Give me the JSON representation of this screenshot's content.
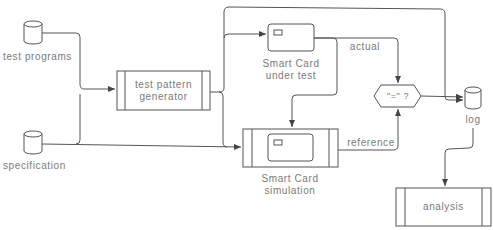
{
  "diagram": {
    "type": "flowchart",
    "nodes": {
      "test_programs": {
        "label": "test programs",
        "shape": "database"
      },
      "specification": {
        "label": "specification",
        "shape": "database"
      },
      "generator": {
        "line1": "test pattern",
        "line2": "generator",
        "shape": "process"
      },
      "card_under_test": {
        "line1": "Smart Card",
        "line2": "under test",
        "shape": "smart-card"
      },
      "card_simulation": {
        "line1": "Smart Card",
        "line2": "simulation",
        "shape": "process-with-card"
      },
      "compare": {
        "label": "\"=\" ?",
        "shape": "hexagon"
      },
      "log": {
        "label": "log",
        "shape": "database"
      },
      "analysis": {
        "label": "analysis",
        "shape": "process"
      }
    },
    "edge_labels": {
      "actual": "actual",
      "reference": "reference"
    },
    "edges": [
      {
        "from": "test programs",
        "to": "test pattern generator"
      },
      {
        "from": "specification",
        "to": "test pattern generator"
      },
      {
        "from": "specification",
        "to": "Smart Card simulation"
      },
      {
        "from": "test pattern generator",
        "to": "Smart Card under test"
      },
      {
        "from": "test pattern generator",
        "to": "log"
      },
      {
        "from": "Smart Card under test",
        "to": "\"=\" ?",
        "label": "actual"
      },
      {
        "from": "Smart Card under test",
        "to": "Smart Card simulation"
      },
      {
        "from": "Smart Card simulation",
        "to": "\"=\" ?",
        "label": "reference"
      },
      {
        "from": "\"=\" ?",
        "to": "log"
      },
      {
        "from": "log",
        "to": "analysis"
      }
    ],
    "colors": {
      "stroke": "#555555",
      "text": "#7a7a7a",
      "background": "#ffffff"
    }
  }
}
